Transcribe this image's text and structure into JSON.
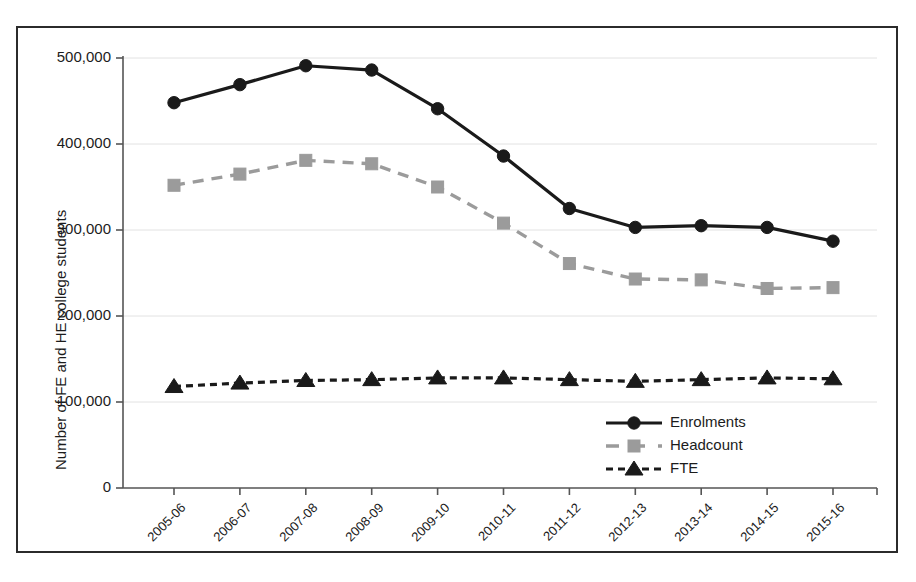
{
  "chart_data": {
    "type": "line",
    "title": "",
    "xlabel": "",
    "ylabel": "Number of FE and HE college students",
    "categories": [
      "2005-06",
      "2006-07",
      "2007-08",
      "2008-09",
      "2009-10",
      "2010-11",
      "2011-12",
      "2012-13",
      "2013-14",
      "2014-15",
      "2015-16"
    ],
    "ylim": [
      0,
      500000
    ],
    "yticks": [
      0,
      100000,
      200000,
      300000,
      400000,
      500000
    ],
    "ytick_labels": [
      "0",
      "100,000",
      "200,000",
      "300,000",
      "400,000",
      "500,000"
    ],
    "grid": true,
    "legend_position": "inside-bottom-right",
    "series": [
      {
        "name": "Enrolments",
        "marker": "circle",
        "line_style": "solid",
        "color": "#1a1a1a",
        "values": [
          448000,
          469000,
          491000,
          486000,
          441000,
          386000,
          325000,
          303000,
          305000,
          303000,
          287000
        ]
      },
      {
        "name": "Headcount",
        "marker": "square",
        "line_style": "dashed",
        "color": "#9b9b9b",
        "values": [
          352000,
          365000,
          381000,
          377000,
          350000,
          308000,
          261000,
          243000,
          242000,
          232000,
          233000
        ]
      },
      {
        "name": "FTE",
        "marker": "triangle",
        "line_style": "dotted-dashed",
        "color": "#1a1a1a",
        "values": [
          118000,
          122000,
          125000,
          126000,
          128000,
          128000,
          126000,
          124000,
          126000,
          128000,
          127000
        ]
      }
    ]
  },
  "legend": {
    "items": [
      {
        "label": "Enrolments"
      },
      {
        "label": "Headcount"
      },
      {
        "label": "FTE"
      }
    ]
  },
  "colors": {
    "enrolments": "#1a1a1a",
    "headcount": "#9b9b9b",
    "fte": "#1a1a1a",
    "axis": "#555555",
    "grid": "#e2e2e2",
    "frame": "#2b2b2b",
    "background": "#ffffff"
  }
}
